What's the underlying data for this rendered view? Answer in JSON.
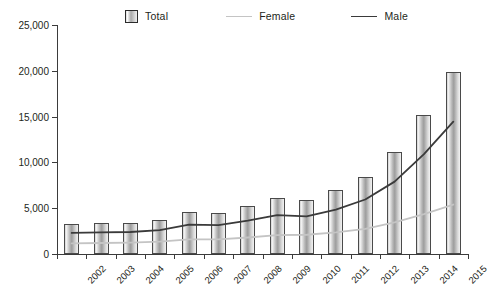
{
  "chart_data": {
    "type": "bar",
    "title": "",
    "subtitle": "",
    "xlabel": "",
    "ylabel": "",
    "grid": false,
    "legend_position": "top",
    "ylim": [
      0,
      25000
    ],
    "yticks": [
      0,
      5000,
      10000,
      15000,
      20000,
      25000
    ],
    "ytick_labels": [
      "0",
      "5,000",
      "10,000",
      "15,000",
      "20,000",
      "25,000"
    ],
    "categories": [
      "2002",
      "2003",
      "2004",
      "2005",
      "2006",
      "2007",
      "2008",
      "2009",
      "2010",
      "2011",
      "2012",
      "2013",
      "2014",
      "2015"
    ],
    "series": [
      {
        "name": "Total",
        "type": "bar",
        "color": "#b4b4b4",
        "values": [
          3250,
          3350,
          3400,
          3700,
          4550,
          4450,
          5250,
          6100,
          5850,
          6950,
          8450,
          11150,
          15150,
          19900
        ]
      },
      {
        "name": "Female",
        "type": "line",
        "color": "#c4c4c4",
        "values": [
          1150,
          1200,
          1250,
          1350,
          1600,
          1600,
          1800,
          2050,
          2100,
          2350,
          2750,
          3450,
          4350,
          5400
        ]
      },
      {
        "name": "Male",
        "type": "line",
        "color": "#3a3a3a",
        "values": [
          2300,
          2350,
          2400,
          2600,
          3200,
          3150,
          3650,
          4250,
          4100,
          4850,
          5950,
          7900,
          10900,
          14450
        ]
      }
    ]
  },
  "legend": {
    "items": [
      {
        "label": "Total",
        "marker": "box-swatch-icon"
      },
      {
        "label": "Female",
        "marker": "line-swatch-icon"
      },
      {
        "label": "Male",
        "marker": "line-swatch-icon"
      }
    ]
  }
}
